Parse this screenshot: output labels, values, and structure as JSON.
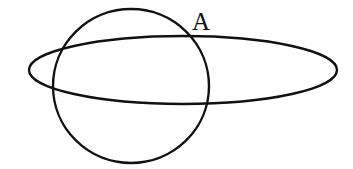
{
  "diagram": {
    "stroke_color": "#111111",
    "background": "#ffffff",
    "shapes": [
      {
        "type": "circle",
        "cx": 131,
        "cy": 86,
        "rx": 78,
        "ry": 77
      },
      {
        "type": "ellipse",
        "cx": 183,
        "cy": 70,
        "rx": 154,
        "ry": 34
      }
    ],
    "labels": [
      {
        "text": "A",
        "x": 192,
        "y": 9
      }
    ]
  }
}
